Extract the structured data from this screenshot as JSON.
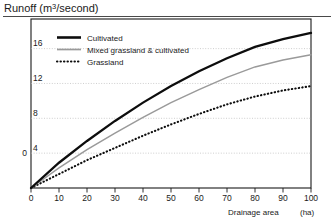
{
  "chart_data": {
    "type": "line",
    "title": "Runoff (m3/second)",
    "title_main": "Runoff (m",
    "title_sup": "3",
    "title_tail": "/second)",
    "xlabel": "Drainage area",
    "xunit": "(ha)",
    "ylabel": "Runoff (m3/second)",
    "xlim": [
      0,
      100
    ],
    "ylim": [
      0,
      19.4
    ],
    "grid": true,
    "grid_axis": "y",
    "legend_position": "top-left-inside",
    "xticks": [
      0,
      10,
      20,
      30,
      40,
      50,
      60,
      70,
      80,
      90,
      100
    ],
    "xtick_labels": [
      "0",
      "10",
      "20",
      "30",
      "40",
      "50",
      "60",
      "70",
      "80",
      "90",
      "100"
    ],
    "yticks": [
      0,
      4,
      8,
      12,
      16
    ],
    "ytick_labels": [
      "0",
      "4",
      "8",
      "12",
      "16"
    ],
    "x": [
      0,
      10,
      20,
      30,
      40,
      50,
      60,
      70,
      80,
      90,
      100
    ],
    "series": [
      {
        "name": "Cultivated",
        "style": "solid-thick-black",
        "color": "#0d0d0d",
        "values": [
          0,
          2.9,
          5.4,
          7.7,
          9.8,
          11.7,
          13.4,
          14.9,
          16.2,
          17.1,
          17.8
        ]
      },
      {
        "name": "Mixed grassland & cultivated",
        "style": "solid-thin-gray",
        "color": "#9a9a9a",
        "values": [
          0,
          2.3,
          4.4,
          6.3,
          8.1,
          9.8,
          11.3,
          12.7,
          13.9,
          14.7,
          15.3
        ]
      },
      {
        "name": "Grassland",
        "style": "dotted-black",
        "color": "#0d0d0d",
        "values": [
          0,
          1.6,
          3.2,
          4.6,
          6.0,
          7.3,
          8.5,
          9.6,
          10.5,
          11.2,
          11.7
        ]
      }
    ],
    "legend": [
      {
        "label": "Cultivated",
        "swatch": "solid-thick-black"
      },
      {
        "label": "Mixed grassland & cultivated",
        "swatch": "solid-thin-gray"
      },
      {
        "label": "Grassland",
        "swatch": "dotted-black"
      }
    ]
  },
  "colors": {
    "cultivated": "#0d0d0d",
    "mixed": "#9a9a9a",
    "grassland": "#0d0d0d",
    "grid": "#b9b9b9",
    "frame": "#1a1a1a",
    "background": "#ffffff"
  }
}
